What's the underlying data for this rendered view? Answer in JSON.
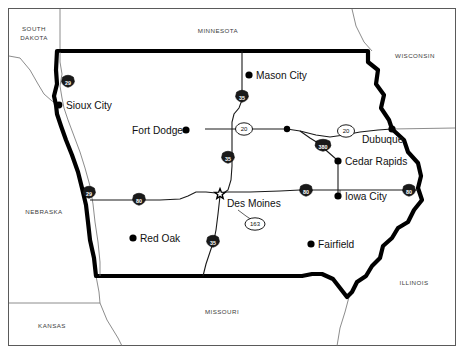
{
  "map": {
    "title": "Iowa State Map",
    "subject_state": "IOWA",
    "frame_color": "#5a5a5a",
    "background_color": "#ffffff",
    "outline_color": "#000000",
    "road_color": "#1a1a1a",
    "label_color": "#3b3b3b"
  },
  "neighbor_states": [
    {
      "id": "south-dakota",
      "label": "SOUTH\nDAKOTA",
      "line1": "SOUTH",
      "line2": "DAKOTA",
      "x": 34,
      "y": 31
    },
    {
      "id": "minnesota",
      "label": "MINNESOTA",
      "line1": "MINNESOTA",
      "line2": "",
      "x": 218,
      "y": 33
    },
    {
      "id": "wisconsin",
      "label": "WISCONSIN",
      "line1": "WISCONSIN",
      "line2": "",
      "x": 415,
      "y": 58
    },
    {
      "id": "nebraska",
      "label": "NEBRASKA",
      "line1": "NEBRASKA",
      "line2": "",
      "x": 44,
      "y": 214
    },
    {
      "id": "illinois",
      "label": "ILLINOIS",
      "line1": "ILLINOIS",
      "line2": "",
      "x": 414,
      "y": 285
    },
    {
      "id": "missouri",
      "label": "MISSOURI",
      "line1": "MISSOURI",
      "line2": "",
      "x": 222,
      "y": 314
    },
    {
      "id": "kansas",
      "label": "KANSAS",
      "line1": "KANSAS",
      "line2": "",
      "x": 52,
      "y": 328
    }
  ],
  "cities": [
    {
      "id": "sioux-city",
      "name": "Sioux City",
      "dot_x": 59,
      "dot_y": 105,
      "label_x": 66,
      "label_y": 109,
      "dot_r": 3.4,
      "anchor": "start",
      "capital": false
    },
    {
      "id": "mason-city",
      "name": "Mason City",
      "dot_x": 249,
      "dot_y": 75,
      "label_x": 256,
      "label_y": 79,
      "dot_r": 3.6,
      "anchor": "start",
      "capital": false
    },
    {
      "id": "fort-dodge",
      "name": "Fort Dodge",
      "dot_x": 186,
      "dot_y": 130,
      "label_x": 183,
      "label_y": 134,
      "dot_r": 3.6,
      "anchor": "end",
      "capital": false
    },
    {
      "id": "dubuque",
      "name": "Dubuque",
      "dot_x": 392,
      "dot_y": 129,
      "label_x": 362,
      "label_y": 143,
      "dot_r": 3.6,
      "anchor": "start",
      "capital": false
    },
    {
      "id": "cedar-rapids",
      "name": "Cedar Rapids",
      "dot_x": 338,
      "dot_y": 161,
      "label_x": 345,
      "label_y": 165,
      "dot_r": 3.6,
      "anchor": "start",
      "capital": false
    },
    {
      "id": "iowa-city",
      "name": "Iowa City",
      "dot_x": 338,
      "dot_y": 196,
      "label_x": 345,
      "label_y": 200,
      "dot_r": 3.6,
      "anchor": "start",
      "capital": false
    },
    {
      "id": "des-moines",
      "name": "Des Moines",
      "dot_x": 220,
      "dot_y": 194,
      "label_x": 227,
      "label_y": 207,
      "dot_r": 0,
      "anchor": "start",
      "capital": true
    },
    {
      "id": "red-oak",
      "name": "Red Oak",
      "dot_x": 133,
      "dot_y": 238,
      "label_x": 140,
      "label_y": 242,
      "dot_r": 3.6,
      "anchor": "start",
      "capital": false
    },
    {
      "id": "fairfield",
      "name": "Fairfield",
      "dot_x": 311,
      "dot_y": 244,
      "label_x": 318,
      "label_y": 248,
      "dot_r": 3.6,
      "anchor": "start",
      "capital": false
    },
    {
      "id": "junction-dot",
      "name": "",
      "dot_x": 287,
      "dot_y": 129,
      "label_x": 0,
      "label_y": 0,
      "dot_r": 3.2,
      "anchor": "start",
      "capital": false
    }
  ],
  "route_markers": [
    {
      "id": "i29-north",
      "type": "interstate",
      "number": "29",
      "x": 68,
      "y": 81
    },
    {
      "id": "i29-south",
      "type": "interstate",
      "number": "29",
      "x": 89,
      "y": 192
    },
    {
      "id": "i35-mason",
      "type": "interstate",
      "number": "35",
      "x": 242,
      "y": 96
    },
    {
      "id": "i35-central",
      "type": "interstate",
      "number": "35",
      "x": 228,
      "y": 157
    },
    {
      "id": "i35-south",
      "type": "interstate",
      "number": "35",
      "x": 213,
      "y": 241
    },
    {
      "id": "i80-west",
      "type": "interstate",
      "number": "80",
      "x": 139,
      "y": 199
    },
    {
      "id": "i80-central",
      "type": "interstate",
      "number": "80",
      "x": 306,
      "y": 190
    },
    {
      "id": "i80-east",
      "type": "interstate",
      "number": "80",
      "x": 409,
      "y": 190
    },
    {
      "id": "i380",
      "type": "interstate",
      "number": "380",
      "x": 323,
      "y": 145
    },
    {
      "id": "us20-west",
      "type": "usroute",
      "number": "20",
      "x": 244,
      "y": 129
    },
    {
      "id": "us20-east",
      "type": "usroute",
      "number": "20",
      "x": 346,
      "y": 131
    },
    {
      "id": "us163",
      "type": "usroute",
      "number": "163",
      "x": 255,
      "y": 224
    }
  ],
  "legend_note": ""
}
